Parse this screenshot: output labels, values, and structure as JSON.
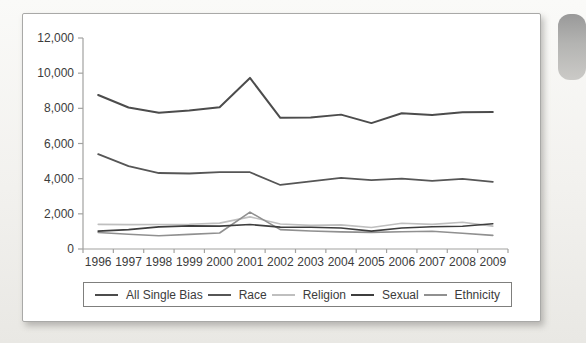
{
  "colors": {
    "axis": "#a2a2a0",
    "text": "#3c3c3c",
    "card_border": "#a9a9a7",
    "legend_border": "#7f7f7d"
  },
  "widgets": {
    "scroll_pill": "vertical gray rounded thumb at right edge"
  },
  "chart_data": {
    "type": "line",
    "title": "",
    "xlabel": "",
    "ylabel": "",
    "x": [
      1996,
      1997,
      1998,
      1999,
      2000,
      2001,
      2002,
      2003,
      2004,
      2005,
      2006,
      2007,
      2008,
      2009
    ],
    "series": [
      {
        "name": "All Single Bias",
        "color": "#4c4c4c",
        "stroke_width": 2,
        "values": [
          8759,
          8049,
          7755,
          7876,
          8063,
          9730,
          7459,
          7485,
          7642,
          7160,
          7720,
          7621,
          7780,
          7789
        ]
      },
      {
        "name": "Race",
        "color": "#565656",
        "stroke_width": 1.8,
        "values": [
          5396,
          4710,
          4321,
          4295,
          4368,
          4367,
          3642,
          3844,
          4042,
          3919,
          4000,
          3870,
          3992,
          3816
        ]
      },
      {
        "name": "Religion",
        "color": "#bfbfbf",
        "stroke_width": 1.6,
        "values": [
          1401,
          1385,
          1390,
          1411,
          1472,
          1828,
          1426,
          1343,
          1374,
          1227,
          1462,
          1400,
          1519,
          1303
        ]
      },
      {
        "name": "Sexual",
        "color": "#3e3e3e",
        "stroke_width": 1.6,
        "values": [
          1016,
          1102,
          1260,
          1317,
          1299,
          1393,
          1244,
          1239,
          1197,
          1017,
          1195,
          1265,
          1297,
          1436
        ]
      },
      {
        "name": "Ethnicity",
        "color": "#909090",
        "stroke_width": 1.6,
        "values": [
          940,
          836,
          754,
          829,
          911,
          2098,
          1102,
          1026,
          972,
          944,
          984,
          1007,
          894,
          777
        ]
      }
    ],
    "draw_order": [
      2,
      4,
      3,
      1,
      0
    ],
    "ylim": [
      0,
      12000
    ],
    "ytick_step": 2000,
    "ytick_labels": [
      "0",
      "2,000",
      "4,000",
      "6,000",
      "8,000",
      "10,000",
      "12,000"
    ],
    "grid": false,
    "legend_position": "bottom"
  }
}
